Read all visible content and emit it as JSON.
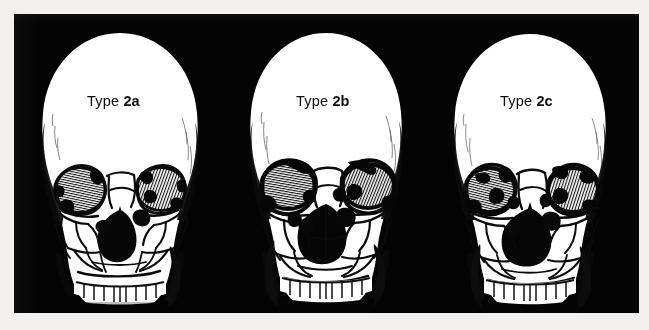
{
  "figure": {
    "caption_text": "",
    "background_color": "#f2f1ef",
    "plate_color": "#040404",
    "bone_color": "#ffffff",
    "ink_color": "#0d0d0d",
    "panel_count": 3
  },
  "panels": [
    {
      "id": "type-2a",
      "label_prefix": "Type ",
      "label_code": "2a",
      "label_full": "Type 2a",
      "position": "left"
    },
    {
      "id": "type-2b",
      "label_prefix": "Type ",
      "label_code": "2b",
      "label_full": "Type 2b",
      "position": "center"
    },
    {
      "id": "type-2c",
      "label_prefix": "Type ",
      "label_code": "2c",
      "label_full": "Type 2c",
      "position": "right"
    }
  ]
}
